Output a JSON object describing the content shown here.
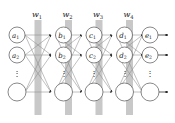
{
  "figure": {
    "background_color": "#ffffff",
    "node_stroke_color": "#4d4d4d",
    "edge_color": "#808080",
    "arrow_color": "#1a1a1a",
    "weight_bar_color": "#c8c8c8",
    "label_color": "#1a1a1a"
  },
  "weight_labels": [
    {
      "id": "w1",
      "text": "w",
      "subscript": "1"
    },
    {
      "id": "w2",
      "text": "w",
      "subscript": "2"
    },
    {
      "id": "w3",
      "text": "w",
      "subscript": "3"
    },
    {
      "id": "w4",
      "text": "w",
      "subscript": "4"
    }
  ],
  "layers": [
    {
      "id": "layer-a",
      "nodes": [
        {
          "id": "a1",
          "text": "a",
          "subscript": "1",
          "labeled": true
        },
        {
          "id": "a2",
          "text": "a",
          "subscript": "2",
          "labeled": true
        },
        {
          "id": "a-ellipsis",
          "text": "⋮",
          "labeled": false,
          "kind": "ellipsis"
        },
        {
          "id": "a-n",
          "text": "",
          "labeled": false,
          "kind": "node"
        }
      ]
    },
    {
      "id": "layer-b",
      "nodes": [
        {
          "id": "b1",
          "text": "b",
          "subscript": "1",
          "labeled": true
        },
        {
          "id": "b2",
          "text": "b",
          "subscript": "2",
          "labeled": true
        },
        {
          "id": "b-ellipsis",
          "text": "⋮",
          "labeled": false,
          "kind": "ellipsis"
        },
        {
          "id": "b-n",
          "text": "",
          "labeled": false,
          "kind": "node"
        }
      ]
    },
    {
      "id": "layer-c",
      "nodes": [
        {
          "id": "c1",
          "text": "c",
          "subscript": "1",
          "labeled": true
        },
        {
          "id": "c2",
          "text": "c",
          "subscript": "2",
          "labeled": true
        },
        {
          "id": "c-ellipsis",
          "text": "⋮",
          "labeled": false,
          "kind": "ellipsis"
        },
        {
          "id": "c-n",
          "text": "",
          "labeled": false,
          "kind": "node"
        }
      ]
    },
    {
      "id": "layer-d",
      "nodes": [
        {
          "id": "d1",
          "text": "d",
          "subscript": "1",
          "labeled": true
        },
        {
          "id": "d2",
          "text": "d",
          "subscript": "2",
          "labeled": true
        },
        {
          "id": "d-ellipsis",
          "text": "⋮",
          "labeled": false,
          "kind": "ellipsis"
        },
        {
          "id": "d-n",
          "text": "",
          "labeled": false,
          "kind": "node"
        }
      ]
    },
    {
      "id": "layer-e",
      "nodes": [
        {
          "id": "e1",
          "text": "e",
          "subscript": "1",
          "labeled": true
        },
        {
          "id": "e2",
          "text": "e",
          "subscript": "2",
          "labeled": true
        },
        {
          "id": "e-ellipsis",
          "text": "⋮",
          "labeled": false,
          "kind": "ellipsis"
        },
        {
          "id": "e-n",
          "text": "",
          "labeled": false,
          "kind": "node"
        }
      ]
    }
  ],
  "output_arrows": [
    {
      "id": "out-1"
    },
    {
      "id": "out-2"
    },
    {
      "id": "out-3"
    }
  ]
}
